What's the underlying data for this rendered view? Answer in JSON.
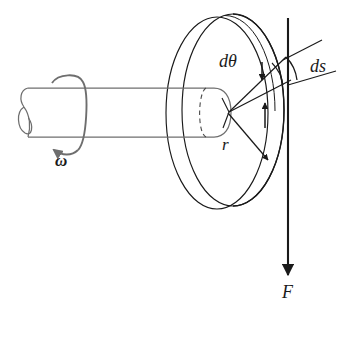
{
  "figure": {
    "name": "rotating-shaft-disk-torque-diagram",
    "background_color": "#ffffff",
    "width": 350,
    "height": 339,
    "line_color_dark": "#1a1a1a",
    "line_color_gray": "#6e6e6e"
  },
  "labels": {
    "angular_velocity": "ω",
    "differential_angle": "dθ",
    "differential_arc": "ds",
    "radius": "r",
    "force": "F"
  },
  "parts": {
    "shaft": "shaft",
    "disk": "disk",
    "disk_rim": "disk-rim",
    "rotation_arrow": "rotation-arrow",
    "radius_arrow": "radius-arrow",
    "force_arrow": "force-arrow",
    "arc_segment": "arc-segment",
    "leader_lines": "leader-lines"
  }
}
